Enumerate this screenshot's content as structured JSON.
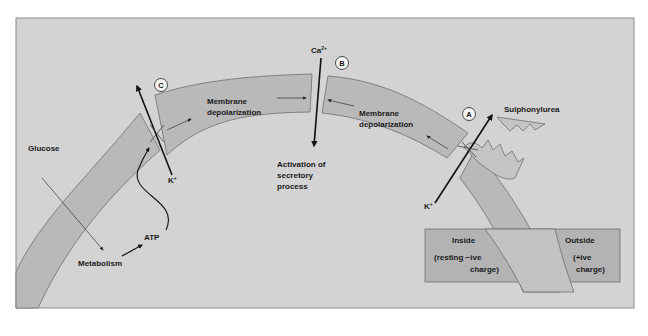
{
  "diagram": {
    "colors": {
      "page_background": "#ffffff",
      "panel_background": "#d3d3d3",
      "panel_border": "#8a8a8a",
      "membrane_fill": "#b9b9b9",
      "membrane_stroke": "#6e6e6e",
      "legend_fill": "#b3b3b3",
      "arrow": "#111111",
      "text": "#1a1a1a"
    },
    "markers": {
      "a": "A",
      "b": "B",
      "c": "C"
    },
    "labels": {
      "glucose": "Glucose",
      "metabolism": "Metabolism",
      "atp": "ATP",
      "k_left": "K",
      "k_left_sup": "+",
      "k_right": "K",
      "k_right_sup": "+",
      "ca": "Ca",
      "ca_sup": "2+",
      "membrane_depol_left_line1": "Membrane",
      "membrane_depol_left_line2": "depolarization",
      "membrane_depol_right_line1": "Membrane",
      "membrane_depol_right_line2": "depolarization",
      "activation_line1": "Activation of",
      "activation_line2": "secretory",
      "activation_line3": "process",
      "sulphonylurea": "Sulphonylurea"
    },
    "legend": {
      "inside_title": "Inside",
      "inside_line1": "(resting −ive",
      "inside_line2": "charge)",
      "outside_title": "Outside",
      "outside_line1": "(+ive",
      "outside_line2": "charge)"
    }
  }
}
